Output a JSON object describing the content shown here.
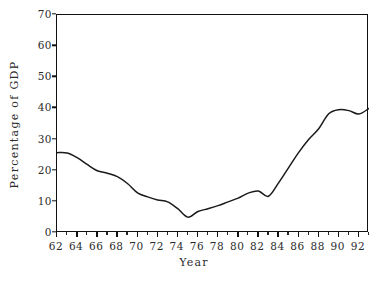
{
  "chart_data": {
    "type": "line",
    "title": "",
    "xlabel": "Year",
    "ylabel": "Percentage of GDP",
    "xlim": [
      62,
      93
    ],
    "ylim": [
      0,
      70
    ],
    "grid": false,
    "legend": null,
    "x_tick_labels": [
      "62",
      "64",
      "66",
      "68",
      "70",
      "72",
      "74",
      "76",
      "78",
      "80",
      "82",
      "84",
      "86",
      "88",
      "90",
      "92"
    ],
    "x_tick_values": [
      62,
      64,
      66,
      68,
      70,
      72,
      74,
      76,
      78,
      80,
      82,
      84,
      86,
      88,
      90,
      92
    ],
    "x_minor_tick_values": [
      63,
      65,
      67,
      69,
      71,
      73,
      75,
      77,
      79,
      81,
      83,
      85,
      87,
      89,
      91,
      93
    ],
    "y_tick_labels": [
      "0",
      "10",
      "20",
      "30",
      "40",
      "50",
      "60",
      "70"
    ],
    "y_tick_values": [
      0,
      10,
      20,
      30,
      40,
      50,
      60,
      70
    ],
    "series": [
      {
        "name": "Percentage of GDP",
        "color": "#1a1a1a",
        "x": [
          62,
          63,
          64,
          65,
          66,
          67,
          68,
          69,
          70,
          71,
          72,
          73,
          74,
          75,
          76,
          77,
          78,
          79,
          80,
          81,
          82,
          83,
          84,
          85,
          86,
          87,
          88,
          89,
          90,
          91,
          92,
          93
        ],
        "values": [
          25.8,
          25.7,
          24.2,
          22.0,
          20.0,
          19.2,
          18.1,
          15.9,
          12.9,
          11.6,
          10.6,
          10.0,
          7.8,
          5.1,
          6.9,
          7.8,
          8.8,
          10.0,
          11.2,
          12.8,
          13.5,
          11.8,
          16.0,
          20.9,
          25.8,
          30.0,
          33.5,
          38.3,
          39.6,
          39.3,
          38.2,
          40.0
        ]
      }
    ],
    "annotations": []
  },
  "axis_titles": {
    "x": "Year",
    "y": "Percentage of GDP"
  }
}
